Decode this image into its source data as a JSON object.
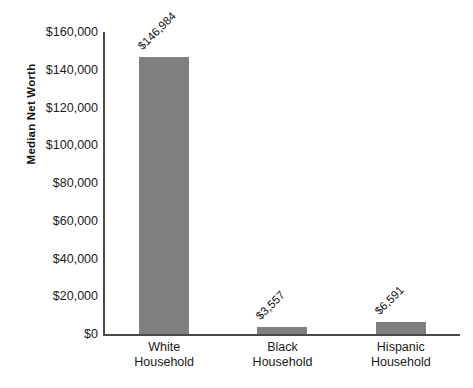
{
  "chart_data": {
    "type": "bar",
    "title": "",
    "subtitle": "",
    "xlabel": "",
    "ylabel": "Median Net Worth",
    "categories": [
      "White Household",
      "Black Household",
      "Hispanic Household"
    ],
    "category_lines": [
      [
        "White",
        "Household"
      ],
      [
        "Black",
        "Household"
      ],
      [
        "Hispanic",
        "Household"
      ]
    ],
    "values": [
      146984,
      3557,
      6591
    ],
    "value_labels": [
      "$146,984",
      "$3,557",
      "$6,591"
    ],
    "ylim": [
      0,
      160000
    ],
    "ytick_values": [
      0,
      20000,
      40000,
      60000,
      80000,
      100000,
      120000,
      140000,
      160000
    ],
    "ytick_labels": [
      "$0",
      "$20,000",
      "$40,000",
      "$60,000",
      "$80,000",
      "$100,000",
      "$120,000",
      "$140,000",
      "$160,000"
    ],
    "grid": false,
    "legend": null,
    "legend_position": "none",
    "annotations": [],
    "colors": {
      "background": "#ffffff",
      "bar_fill": "#808080",
      "axis_line": "#4a4a4a",
      "text": "#1a1a1a"
    }
  }
}
